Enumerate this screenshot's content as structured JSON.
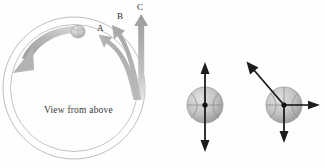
{
  "figure": {
    "title": "",
    "caption_inside_circle": "View from above",
    "arrow_labels": [
      {
        "id": "A",
        "text": "A"
      },
      {
        "id": "B",
        "text": "B"
      },
      {
        "id": "C",
        "text": "C"
      }
    ],
    "colors": {
      "track_line": "#b9b9b9",
      "gray_arrow": "#a8a8a8",
      "gray_arrow_light": "#d4d4d4",
      "ball_gray": "#b0b0b0",
      "black_arrow": "#1a1a1a",
      "background": "#ffffff",
      "label_text": "#2b2b2b"
    },
    "left_panel": {
      "name": "circular-track-view",
      "description": "View from above of a circular track with a ball travelling counterclockwise and three candidate exit-path arrows",
      "ball": {
        "name": "ball-on-track"
      },
      "motion_arrow": {
        "name": "counterclockwise-motion-arrow"
      },
      "paths": [
        "A",
        "B",
        "C"
      ]
    },
    "right_panel": {
      "name": "ball-vector-diagrams",
      "diagrams": [
        {
          "name": "ball-diagram-1",
          "vectors": [
            {
              "name": "up-arrow",
              "direction": "up"
            },
            {
              "name": "down-arrow",
              "direction": "down"
            }
          ]
        },
        {
          "name": "ball-diagram-2",
          "vectors": [
            {
              "name": "up-left-diagonal-arrow",
              "direction": "up-left"
            },
            {
              "name": "right-arrow",
              "direction": "right"
            },
            {
              "name": "down-arrow",
              "direction": "down"
            }
          ]
        }
      ]
    }
  }
}
